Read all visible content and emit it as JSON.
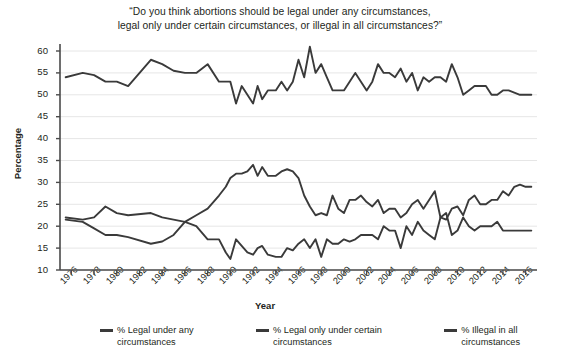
{
  "chart_data": {
    "type": "line",
    "title": "“Do you think abortions should be legal under any circumstances, legal only under certain circumstances, or illegal in all circumstances?”",
    "xlabel": "Year",
    "ylabel": "Percentage",
    "ylim": [
      10,
      60
    ],
    "yticks": [
      10,
      15,
      20,
      25,
      30,
      35,
      40,
      45,
      50,
      55,
      60
    ],
    "xlim": [
      1975,
      2017
    ],
    "xticks": [
      1976,
      1978,
      1980,
      1982,
      1984,
      1986,
      1988,
      1990,
      1992,
      1994,
      1996,
      1998,
      2000,
      2002,
      2004,
      2006,
      2008,
      2010,
      2012,
      2014,
      2016
    ],
    "grid": true,
    "legend_position": "bottom",
    "line_color": "#3a3a3a",
    "series": [
      {
        "name": "% Legal under any circumstances",
        "x": [
          1975.5,
          1977,
          1978,
          1979,
          1980,
          1981,
          1983,
          1984,
          1985,
          1986,
          1987,
          1988,
          1989,
          1989.6,
          1990,
          1990.5,
          1991,
          1991.5,
          1992,
          1992.4,
          1992.8,
          1993.3,
          1994,
          1994.5,
          1995,
          1995.5,
          1996,
          1996.5,
          1997,
          1997.5,
          1998,
          1998.5,
          1999,
          1999.5,
          2000,
          2000.5,
          2001,
          2001.5,
          2002,
          2002.5,
          2003,
          2003.5,
          2004,
          2004.5,
          2005,
          2005.5,
          2006,
          2006.5,
          2007,
          2007.5,
          2008,
          2008.5,
          2009,
          2009.5,
          2010,
          2010.5,
          2011,
          2011.5,
          2012,
          2012.5,
          2013,
          2013.5,
          2014,
          2014.5,
          2015,
          2015.5,
          2016,
          2016.5
        ],
        "values": [
          21.5,
          21.0,
          19.5,
          18.0,
          18.0,
          17.5,
          16.0,
          16.5,
          18.0,
          21.0,
          22.5,
          24.0,
          27.0,
          29.0,
          31.0,
          32.0,
          32.0,
          32.5,
          34.0,
          31.5,
          33.5,
          31.5,
          31.5,
          32.5,
          33.0,
          32.5,
          31.0,
          27.0,
          24.5,
          22.5,
          23.0,
          22.5,
          27.0,
          24.0,
          23.0,
          26.0,
          26.0,
          27.0,
          25.5,
          24.5,
          26.0,
          23.0,
          24.0,
          24.0,
          22.0,
          23.0,
          25.0,
          26.0,
          24.0,
          26.0,
          28.0,
          22.0,
          21.5,
          24.0,
          24.5,
          22.5,
          26.0,
          27.0,
          25.0,
          25.0,
          26.0,
          26.0,
          28.0,
          27.0,
          29.0,
          29.5,
          29.0,
          29.0
        ]
      },
      {
        "name": "% Legal only under certain circumstances",
        "x": [
          1975.5,
          1977,
          1978,
          1979,
          1980,
          1981,
          1983,
          1984,
          1985,
          1986,
          1987,
          1988,
          1989,
          1989.6,
          1990,
          1990.5,
          1991,
          1991.5,
          1992,
          1992.4,
          1992.8,
          1993.3,
          1994,
          1994.5,
          1995,
          1995.5,
          1996,
          1996.5,
          1997,
          1997.5,
          1998,
          1998.5,
          1999,
          1999.5,
          2000,
          2000.5,
          2001,
          2001.5,
          2002,
          2002.5,
          2003,
          2003.5,
          2004,
          2004.5,
          2005,
          2005.5,
          2006,
          2006.5,
          2007,
          2007.5,
          2008,
          2008.5,
          2009,
          2009.5,
          2010,
          2010.5,
          2011,
          2011.5,
          2012,
          2012.5,
          2013,
          2013.5,
          2014,
          2014.5,
          2015,
          2015.5,
          2016,
          2016.5
        ],
        "values": [
          54.0,
          55.0,
          54.5,
          53.0,
          53.0,
          52.0,
          58.0,
          57.0,
          55.5,
          55.0,
          55.0,
          57.0,
          53.0,
          53.0,
          53.0,
          48.0,
          52.0,
          50.0,
          48.0,
          52.0,
          49.0,
          51.0,
          51.0,
          53.0,
          51.0,
          53.0,
          58.0,
          54.0,
          61.0,
          55.0,
          57.0,
          54.0,
          51.0,
          51.0,
          51.0,
          53.0,
          55.0,
          53.0,
          51.0,
          53.0,
          57.0,
          55.0,
          55.0,
          54.0,
          56.0,
          53.0,
          55.0,
          51.0,
          54.0,
          53.0,
          54.0,
          54.0,
          53.0,
          57.0,
          54.0,
          50.0,
          51.0,
          52.0,
          52.0,
          52.0,
          50.0,
          50.0,
          51.0,
          51.0,
          50.5,
          50.0,
          50.0,
          50.0
        ]
      },
      {
        "name": "% Illegal in all circumstances",
        "x": [
          1975.5,
          1977,
          1978,
          1979,
          1980,
          1981,
          1983,
          1984,
          1985,
          1986,
          1987,
          1988,
          1989,
          1989.6,
          1990,
          1990.5,
          1991,
          1991.5,
          1992,
          1992.4,
          1992.8,
          1993.3,
          1994,
          1994.5,
          1995,
          1995.5,
          1996,
          1996.5,
          1997,
          1997.5,
          1998,
          1998.5,
          1999,
          1999.5,
          2000,
          2000.5,
          2001,
          2001.5,
          2002,
          2002.5,
          2003,
          2003.5,
          2004,
          2004.5,
          2005,
          2005.5,
          2006,
          2006.5,
          2007,
          2007.5,
          2008,
          2008.5,
          2009,
          2009.5,
          2010,
          2010.5,
          2011,
          2011.5,
          2012,
          2012.5,
          2013,
          2013.5,
          2014,
          2014.5,
          2015,
          2015.5,
          2016,
          2016.5
        ],
        "values": [
          22.0,
          21.5,
          22.0,
          24.5,
          23.0,
          22.5,
          23.0,
          22.0,
          21.5,
          21.0,
          20.0,
          17.0,
          17.0,
          14.0,
          12.5,
          17.0,
          15.5,
          14.0,
          13.5,
          15.0,
          15.5,
          13.5,
          13.0,
          13.0,
          15.0,
          14.5,
          16.0,
          17.0,
          15.0,
          17.0,
          13.0,
          17.0,
          16.0,
          16.0,
          17.0,
          16.5,
          17.0,
          18.0,
          18.0,
          18.0,
          17.0,
          20.0,
          19.0,
          19.0,
          15.0,
          20.0,
          18.0,
          21.0,
          19.0,
          18.0,
          17.0,
          22.0,
          23.0,
          18.0,
          19.0,
          22.0,
          20.0,
          19.0,
          20.0,
          20.0,
          20.0,
          21.0,
          19.0,
          19.0,
          19.0,
          19.0,
          19.0,
          19.0
        ]
      }
    ]
  },
  "axis": {
    "ylabel": "Percentage",
    "xlabel": "Year"
  },
  "legend": {
    "items": [
      {
        "label_line1": "% Legal under any",
        "label_line2": "circumstances"
      },
      {
        "label_line1": "% Legal only under certain",
        "label_line2": "circumstances"
      },
      {
        "label_line1": "% Illegal in all",
        "label_line2": "circumstances"
      }
    ]
  },
  "title": {
    "line1": "“Do you think abortions should be legal under any circumstances,",
    "line2": "legal only under certain circumstances, or illegal in all circumstances?”"
  }
}
